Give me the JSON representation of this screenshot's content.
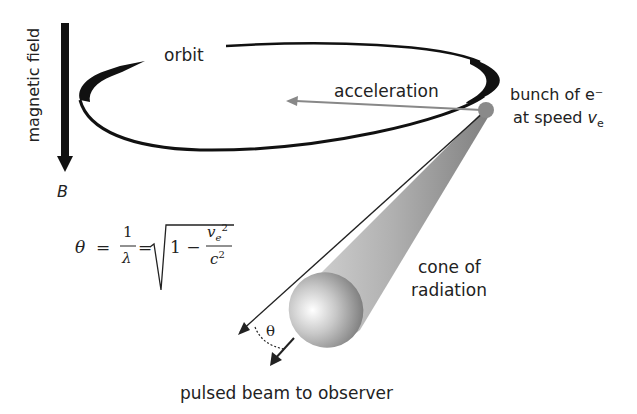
{
  "labels": {
    "magnetic_field": "magnetic field",
    "B": "B",
    "orbit": "orbit",
    "acceleration": "acceleration",
    "bunch_line1": "bunch of e⁻",
    "bunch_line2_prefix": "at speed ",
    "bunch_v": "v",
    "bunch_sub": "e",
    "cone_line1": "cone of",
    "cone_line2": "radiation",
    "theta_angle": "θ",
    "pulsed_beam": "pulsed beam to observer"
  },
  "formula": {
    "lhs": "θ",
    "eq1": "=",
    "num": "1",
    "den": "λ",
    "eq2": "=",
    "one_minus": "1 −",
    "v": "v",
    "v_sub": "e",
    "v_sup": "2",
    "c": "c",
    "c_sup": "2"
  },
  "colors": {
    "ink": "#111111",
    "arrow_gray": "#888888",
    "electron_bunch": "#8a8a8a",
    "cone_gray": "#a0a0a0"
  }
}
